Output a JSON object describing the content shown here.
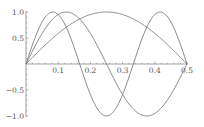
{
  "chart_data": {
    "type": "line",
    "title": "",
    "xlabel": "",
    "ylabel": "",
    "xlim": [
      0,
      0.5
    ],
    "ylim": [
      -1.0,
      1.0
    ],
    "grid": false,
    "legend": null,
    "x_ticks": [
      "0.1",
      "0.2",
      "0.3",
      "0.4",
      "0.5"
    ],
    "x_tick_values": [
      0.1,
      0.2,
      0.3,
      0.4,
      0.5
    ],
    "y_ticks": [
      "1.0",
      "0.5",
      "-0.5",
      "-1.0"
    ],
    "y_tick_values": [
      1.0,
      0.5,
      -0.5,
      -1.0
    ],
    "series": [
      {
        "name": "sin(2πx)",
        "frequency": 1,
        "x": [
          0,
          0.125,
          0.25,
          0.375,
          0.5
        ],
        "values": [
          0,
          0.707,
          1.0,
          0.707,
          0
        ]
      },
      {
        "name": "sin(4πx)",
        "frequency": 2,
        "x": [
          0,
          0.125,
          0.25,
          0.375,
          0.5
        ],
        "values": [
          0,
          1.0,
          0,
          -1.0,
          0
        ]
      },
      {
        "name": "sin(6πx)",
        "frequency": 3,
        "x": [
          0,
          0.0833,
          0.1667,
          0.25,
          0.3333,
          0.4167,
          0.5
        ],
        "values": [
          0,
          1.0,
          0,
          -1.0,
          0,
          1.0,
          0
        ]
      }
    ],
    "line_color": "#7a7a7a",
    "axis_color": "#888888"
  }
}
